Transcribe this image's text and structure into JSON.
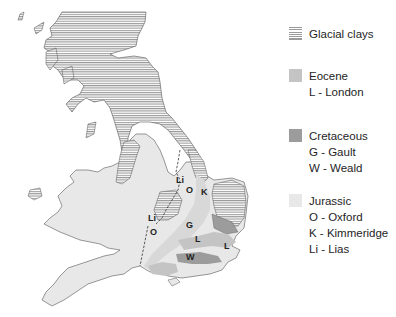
{
  "legend": {
    "items": [
      {
        "key": "glacial",
        "title": "Glacial clays",
        "lines": [],
        "fill": "hatched",
        "color": "#9a9a9a"
      },
      {
        "key": "eocene",
        "title": "Eocene",
        "lines": [
          "L - London"
        ],
        "fill": "solid",
        "color": "#c4c4c4"
      },
      {
        "key": "cretaceous",
        "title": "Cretaceous",
        "lines": [
          "G - Gault",
          "W - Weald"
        ],
        "fill": "solid",
        "color": "#9c9c9c"
      },
      {
        "key": "jurassic",
        "title": "Jurassic",
        "lines": [
          "O - Oxford",
          "K - Kimmeridge",
          "Li - Lias"
        ],
        "fill": "solid",
        "color": "#e8e8e8"
      }
    ]
  },
  "map": {
    "labels": [
      {
        "text": "Li",
        "x": 176,
        "y": 183
      },
      {
        "text": "O",
        "x": 186,
        "y": 193
      },
      {
        "text": "K",
        "x": 201,
        "y": 195
      },
      {
        "text": "G",
        "x": 186,
        "y": 228
      },
      {
        "text": "Li",
        "x": 148,
        "y": 221
      },
      {
        "text": "O",
        "x": 150,
        "y": 235
      },
      {
        "text": "L",
        "x": 195,
        "y": 242
      },
      {
        "text": "L",
        "x": 224,
        "y": 249
      },
      {
        "text": "W",
        "x": 186,
        "y": 260
      }
    ]
  }
}
